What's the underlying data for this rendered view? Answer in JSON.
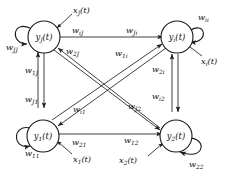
{
  "diagram": {
    "type": "recurrent-neural-network",
    "background_color": "#ffffff",
    "line_color": "#2b2b2b",
    "node_fill": "#ffffff",
    "node_stroke": "#1a1a1a",
    "nodes": [
      {
        "id": "J",
        "label_base": "y",
        "label_sub": "J",
        "label_arg": "(t)",
        "position": "top-left",
        "self_weight_base": "w",
        "self_weight_sub": "JJ",
        "input_base": "x",
        "input_sub": "J",
        "input_arg": "(t)"
      },
      {
        "id": "i",
        "label_base": "y",
        "label_sub": "i",
        "label_arg": "(t)",
        "position": "top-right",
        "self_weight_base": "w",
        "self_weight_sub": "ii",
        "input_base": "x",
        "input_sub": "i",
        "input_arg": "(t)"
      },
      {
        "id": "1",
        "label_base": "y",
        "label_sub": "1",
        "label_arg": "(t)",
        "position": "bottom-left",
        "self_weight_base": "w",
        "self_weight_sub": "11",
        "input_base": "x",
        "input_sub": "1",
        "input_arg": "(t)"
      },
      {
        "id": "2",
        "label_base": "y",
        "label_sub": "2",
        "label_arg": "(t)",
        "position": "bottom-right",
        "self_weight_base": "w",
        "self_weight_sub": "22",
        "input_base": "x",
        "input_sub": "2",
        "input_arg": "(t)"
      }
    ],
    "edges": [
      {
        "from": "i",
        "to": "J",
        "base": "w",
        "sub": "iJ",
        "route": "top-horizontal"
      },
      {
        "from": "J",
        "to": "i",
        "base": "w",
        "sub": "Ji",
        "route": "top-horizontal"
      },
      {
        "from": "1",
        "to": "J",
        "base": "w",
        "sub": "1J",
        "route": "left-vertical"
      },
      {
        "from": "J",
        "to": "1",
        "base": "w",
        "sub": "J1",
        "route": "left-vertical"
      },
      {
        "from": "2",
        "to": "i",
        "base": "w",
        "sub": "2i",
        "route": "right-vertical"
      },
      {
        "from": "i",
        "to": "2",
        "base": "w",
        "sub": "i2",
        "route": "right-vertical"
      },
      {
        "from": "2",
        "to": "1",
        "base": "w",
        "sub": "21",
        "route": "bottom-horizontal"
      },
      {
        "from": "1",
        "to": "2",
        "base": "w",
        "sub": "12",
        "route": "bottom-horizontal"
      },
      {
        "from": "2",
        "to": "J",
        "base": "w",
        "sub": "2J",
        "route": "diagonal-br-tl"
      },
      {
        "from": "i",
        "to": "1",
        "base": "w",
        "sub": "i1",
        "route": "diagonal-tr-bl"
      },
      {
        "from": "1",
        "to": "i",
        "base": "w",
        "sub": "1i",
        "route": "diagonal-bl-tr"
      },
      {
        "from": "J",
        "to": "2",
        "base": "w",
        "sub": "J2",
        "route": "diagonal-tl-br"
      }
    ]
  }
}
